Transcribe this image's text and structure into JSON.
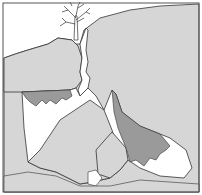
{
  "figure": {
    "colors": {
      "rock": "#d6d6d6",
      "sediment": "#9a9a9a",
      "void": "#ffffff",
      "outline": "#333333",
      "frame": "#555555"
    },
    "elements": [
      {
        "id": "surface",
        "label": "ground surface"
      },
      {
        "id": "tree",
        "label": "tree"
      },
      {
        "id": "fissure",
        "label": "vertical fissure"
      },
      {
        "id": "cave",
        "label": "cave chamber"
      },
      {
        "id": "blocks",
        "label": "collapsed blocks"
      },
      {
        "id": "sediment",
        "label": "sediment fill"
      }
    ]
  }
}
